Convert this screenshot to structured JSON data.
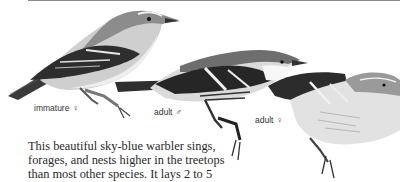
{
  "plate": {
    "figures": [
      {
        "id": "immature-female",
        "label": "immature",
        "sex_symbol": "♀"
      },
      {
        "id": "adult-male",
        "label": "adult",
        "sex_symbol": "♂"
      },
      {
        "id": "adult-female",
        "label": "adult",
        "sex_symbol": "♀"
      }
    ]
  },
  "description": {
    "lines": [
      "This beautiful sky-blue warbler sings,",
      "forages, and nests higher in the treetops",
      "than most other species. It lays 2 to 5"
    ]
  },
  "colors": {
    "ink": "#2a2a2a",
    "rule": "#8a8a8a",
    "background": "#ffffff"
  }
}
